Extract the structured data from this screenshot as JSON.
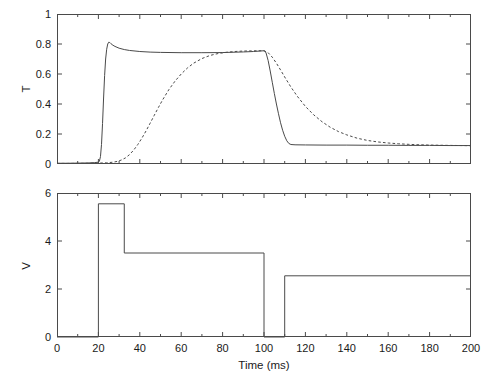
{
  "figure": {
    "background": "#ffffff",
    "line_color": "#4a4a4a",
    "axis_color": "#4a4a4a",
    "text_color": "#1a1a1a"
  },
  "xaxis": {
    "label": "Time (ms)",
    "ticks": [
      0,
      20,
      40,
      60,
      80,
      100,
      120,
      140,
      160,
      180,
      200
    ],
    "tick_labels": [
      "0",
      "20",
      "40",
      "60",
      "80",
      "100",
      "120",
      "140",
      "160",
      "180",
      "200"
    ],
    "min": 0,
    "max": 200,
    "unit": "ms"
  },
  "top_panel": {
    "ylabel": "T",
    "yticks": [
      0,
      0.2,
      0.4,
      0.6,
      0.8,
      1
    ],
    "ytick_labels": [
      "0",
      "0.2",
      "0.4",
      "0.6",
      "0.8",
      "1"
    ],
    "ymin": 0,
    "ymax": 1
  },
  "bottom_panel": {
    "ylabel": "V",
    "yticks": [
      0,
      2,
      4,
      6
    ],
    "ytick_labels": [
      "0",
      "2",
      "4",
      "6"
    ],
    "ymin": 0,
    "ymax": 6
  },
  "chart_data": [
    {
      "type": "line",
      "title": "",
      "xlabel": "",
      "ylabel": "T",
      "xlim": [
        0,
        200
      ],
      "ylim": [
        0,
        1
      ],
      "grid": false,
      "legend": "none",
      "panel": "top",
      "series": [
        {
          "name": "solid-trace",
          "style": "solid",
          "color": "#4a4a4a",
          "x": [
            0,
            5,
            10,
            15,
            18,
            20,
            20.5,
            21,
            21.5,
            22,
            22.5,
            23,
            23.5,
            24,
            24.5,
            25,
            25.5,
            26,
            27,
            28,
            30,
            32.5,
            35,
            40,
            45,
            50,
            60,
            70,
            80,
            90,
            95,
            99,
            100,
            100.5,
            101,
            102,
            103,
            104,
            105,
            106,
            107,
            108,
            109,
            110,
            111,
            112,
            113,
            115,
            120,
            130,
            140,
            150,
            160,
            170,
            180,
            190,
            200
          ],
          "y": [
            0.005,
            0.005,
            0.006,
            0.007,
            0.009,
            0.012,
            0.02,
            0.05,
            0.13,
            0.27,
            0.44,
            0.59,
            0.7,
            0.765,
            0.8,
            0.812,
            0.81,
            0.803,
            0.792,
            0.784,
            0.772,
            0.763,
            0.757,
            0.75,
            0.746,
            0.744,
            0.742,
            0.742,
            0.743,
            0.747,
            0.75,
            0.754,
            0.755,
            0.752,
            0.74,
            0.69,
            0.62,
            0.545,
            0.47,
            0.4,
            0.335,
            0.275,
            0.225,
            0.185,
            0.155,
            0.137,
            0.13,
            0.128,
            0.127,
            0.126,
            0.126,
            0.125,
            0.125,
            0.124,
            0.124,
            0.123,
            0.123
          ]
        },
        {
          "name": "dashed-trace",
          "style": "dashed",
          "color": "#4a4a4a",
          "x": [
            0,
            5,
            10,
            15,
            20,
            24,
            27,
            29,
            31,
            33,
            35,
            37,
            39,
            41,
            43,
            45,
            47,
            49,
            51,
            54,
            57,
            60,
            63,
            66,
            70,
            74,
            78,
            82,
            86,
            90,
            94,
            97,
            100,
            102,
            104,
            106,
            108,
            110,
            113,
            116,
            120,
            124,
            128,
            132,
            136,
            140,
            145,
            150,
            155,
            160,
            165,
            170,
            175,
            180,
            185,
            190,
            195,
            200
          ],
          "y": [
            0.004,
            0.004,
            0.004,
            0.005,
            0.006,
            0.008,
            0.012,
            0.017,
            0.026,
            0.04,
            0.062,
            0.092,
            0.129,
            0.172,
            0.22,
            0.272,
            0.325,
            0.377,
            0.427,
            0.495,
            0.552,
            0.6,
            0.64,
            0.672,
            0.703,
            0.724,
            0.737,
            0.745,
            0.75,
            0.753,
            0.754,
            0.755,
            0.755,
            0.742,
            0.712,
            0.672,
            0.627,
            0.58,
            0.513,
            0.453,
            0.384,
            0.328,
            0.282,
            0.245,
            0.216,
            0.194,
            0.172,
            0.157,
            0.147,
            0.14,
            0.135,
            0.131,
            0.128,
            0.126,
            0.125,
            0.124,
            0.123,
            0.122
          ]
        }
      ]
    },
    {
      "type": "line",
      "title": "",
      "xlabel": "Time (ms)",
      "ylabel": "V",
      "xlim": [
        0,
        200
      ],
      "ylim": [
        0,
        6
      ],
      "grid": false,
      "legend": "none",
      "panel": "bottom",
      "series": [
        {
          "name": "voltage-step-trace",
          "style": "solid",
          "color": "#4a4a4a",
          "x": [
            0,
            20,
            20,
            32.5,
            32.5,
            100,
            100,
            110,
            110,
            200
          ],
          "y": [
            0,
            0,
            5.55,
            5.55,
            3.5,
            3.5,
            0,
            0,
            2.55,
            2.55
          ]
        }
      ],
      "steps": [
        {
          "from": 0,
          "to": 20,
          "value": 0
        },
        {
          "from": 20,
          "to": 32.5,
          "value": 5.55
        },
        {
          "from": 32.5,
          "to": 100,
          "value": 3.5
        },
        {
          "from": 100,
          "to": 110,
          "value": 0
        },
        {
          "from": 110,
          "to": 200,
          "value": 2.55
        }
      ]
    }
  ]
}
